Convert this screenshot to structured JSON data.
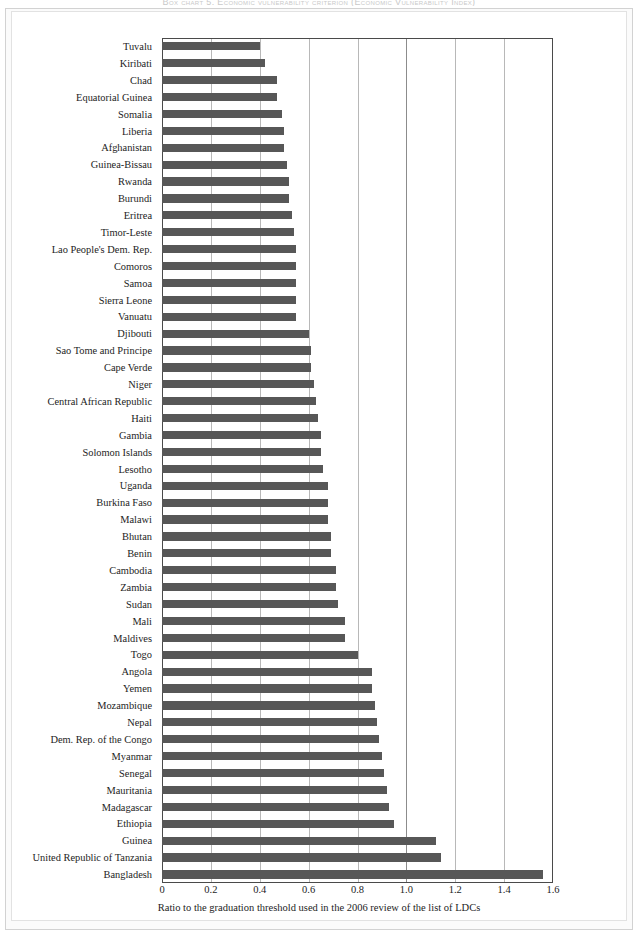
{
  "figure": {
    "title": "Box chart 5. Economic vulnerability criterion (Economic Vulnerability Index)"
  },
  "chart_data": {
    "type": "bar",
    "orientation": "horizontal",
    "title": "Box chart 5. Economic vulnerability criterion (Economic Vulnerability Index)",
    "xlabel": "Ratio to the graduation threshold used in the 2006 review of the list of LDCs",
    "ylabel": "",
    "xlim": [
      0,
      1.6
    ],
    "xticks": [
      "0",
      "0.2",
      "0.4",
      "0.6",
      "0.8",
      "1.0",
      "1.2",
      "1.4",
      "1.6"
    ],
    "xtick_values": [
      0,
      0.2,
      0.4,
      0.6,
      0.8,
      1.0,
      1.2,
      1.4,
      1.6
    ],
    "grid": "vertical",
    "legend": "none",
    "bar_color": "#575757",
    "axis_color": "#4a4a4a",
    "gridline_color": "#b8b8b8",
    "categories": [
      "Tuvalu",
      "Kiribati",
      "Chad",
      "Equatorial Guinea",
      "Somalia",
      "Liberia",
      "Afghanistan",
      "Guinea-Bissau",
      "Rwanda",
      "Burundi",
      "Eritrea",
      "Timor-Leste",
      "Lao People's Dem. Rep.",
      "Comoros",
      "Samoa",
      "Sierra Leone",
      "Vanuatu",
      "Djibouti",
      "Sao Tome and Principe",
      "Cape Verde",
      "Niger",
      "Central African Republic",
      "Haiti",
      "Gambia",
      "Solomon Islands",
      "Lesotho",
      "Uganda",
      "Burkina Faso",
      "Malawi",
      "Bhutan",
      "Benin",
      "Cambodia",
      "Zambia",
      "Sudan",
      "Mali",
      "Maldives",
      "Togo",
      "Angola",
      "Yemen",
      "Mozambique",
      "Nepal",
      "Dem. Rep. of the Congo",
      "Myanmar",
      "Senegal",
      "Mauritania",
      "Madagascar",
      "Ethiopia",
      "Guinea",
      "United Republic of Tanzania",
      "Bangladesh"
    ],
    "values": [
      0.4,
      0.42,
      0.47,
      0.47,
      0.49,
      0.5,
      0.5,
      0.51,
      0.52,
      0.52,
      0.53,
      0.54,
      0.55,
      0.55,
      0.55,
      0.55,
      0.55,
      0.6,
      0.61,
      0.61,
      0.62,
      0.63,
      0.64,
      0.65,
      0.65,
      0.66,
      0.68,
      0.68,
      0.68,
      0.69,
      0.69,
      0.71,
      0.71,
      0.72,
      0.75,
      0.75,
      0.8,
      0.86,
      0.86,
      0.87,
      0.88,
      0.89,
      0.9,
      0.91,
      0.92,
      0.93,
      0.95,
      1.12,
      1.14,
      1.56
    ]
  }
}
